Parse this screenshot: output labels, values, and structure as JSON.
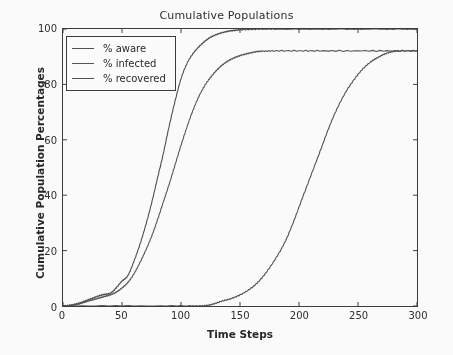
{
  "chart_data": {
    "type": "line",
    "title": "Cumulative Populations",
    "xlabel": "Time Steps",
    "ylabel": "Cumulative Population Percentages",
    "xlim": [
      0,
      300
    ],
    "ylim": [
      0,
      100
    ],
    "xticks": [
      0,
      50,
      100,
      150,
      200,
      250,
      300
    ],
    "yticks": [
      0,
      20,
      40,
      60,
      80,
      100
    ],
    "xtick_labels": [
      "0",
      "50",
      "100",
      "150",
      "200",
      "250",
      "300"
    ],
    "ytick_labels": [
      "0",
      "20",
      "40",
      "60",
      "80",
      "100"
    ],
    "grid": false,
    "legend_position": "upper left",
    "background_color": "#fefefe",
    "axis_color": "#3a3a3a",
    "series": [
      {
        "name": "% aware",
        "color": "#4d4d4d",
        "x": [
          0,
          5,
          10,
          15,
          20,
          25,
          30,
          35,
          40,
          45,
          50,
          55,
          60,
          65,
          70,
          75,
          80,
          85,
          90,
          95,
          100,
          105,
          110,
          115,
          120,
          125,
          130,
          135,
          140,
          145,
          150,
          160,
          170,
          180,
          200,
          220,
          250,
          280,
          300
        ],
        "values": [
          0,
          0.2,
          0.6,
          1.2,
          2.0,
          2.8,
          3.6,
          4.2,
          4.6,
          6.5,
          9.0,
          11.0,
          16.0,
          22.0,
          29.0,
          37.0,
          46.0,
          55.0,
          65.0,
          74.0,
          82.0,
          87.5,
          91.0,
          93.5,
          95.5,
          97.0,
          98.0,
          98.7,
          99.2,
          99.5,
          99.7,
          99.9,
          100,
          100,
          100,
          100,
          100,
          100,
          100
        ]
      },
      {
        "name": "% infected",
        "color": "#555555",
        "x": [
          0,
          5,
          10,
          15,
          20,
          25,
          30,
          35,
          40,
          45,
          50,
          55,
          60,
          65,
          70,
          75,
          80,
          85,
          90,
          95,
          100,
          105,
          110,
          115,
          120,
          125,
          130,
          135,
          140,
          145,
          150,
          155,
          160,
          165,
          170,
          180,
          200,
          220,
          250,
          280,
          300
        ],
        "values": [
          0,
          0.1,
          0.4,
          0.9,
          1.6,
          2.2,
          2.8,
          3.4,
          4.0,
          5.0,
          6.5,
          8.5,
          11.5,
          15.5,
          20.0,
          25.0,
          31.0,
          37.5,
          44.0,
          51.0,
          58.0,
          64.5,
          70.5,
          75.5,
          79.5,
          82.5,
          85.0,
          87.0,
          88.5,
          89.6,
          90.4,
          91.0,
          91.5,
          91.9,
          92.0,
          92.1,
          92.1,
          92.1,
          92.1,
          92.1,
          92.1
        ]
      },
      {
        "name": "% recovered",
        "color": "#505050",
        "x": [
          0,
          50,
          100,
          115,
          122,
          128,
          135,
          142,
          150,
          158,
          165,
          172,
          180,
          188,
          195,
          202,
          210,
          218,
          225,
          232,
          240,
          248,
          255,
          262,
          268,
          274,
          280,
          285,
          300
        ],
        "values": [
          0,
          0,
          0,
          0,
          0.2,
          0.8,
          1.8,
          2.6,
          4.0,
          6.0,
          8.5,
          12.0,
          17.0,
          23.0,
          30.0,
          38.0,
          47.0,
          56.0,
          64.0,
          71.0,
          77.5,
          82.5,
          86.0,
          88.5,
          90.0,
          91.2,
          91.9,
          92.1,
          92.1
        ]
      }
    ]
  }
}
